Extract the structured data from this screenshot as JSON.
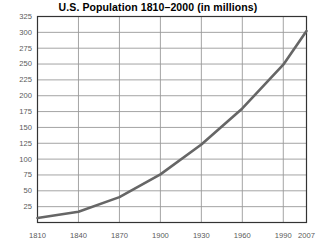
{
  "chart_data": {
    "type": "line",
    "title": "U.S. Population 1810–2000 (in millions)",
    "xlabel": "",
    "ylabel": "",
    "grid": true,
    "legend": null,
    "xlim": [
      1810,
      2007
    ],
    "ylim": [
      0,
      325
    ],
    "x_ticks": [
      1810,
      1840,
      1870,
      1900,
      1930,
      1960,
      1990,
      2007
    ],
    "x_tick_labels": [
      "1810",
      "1840",
      "1870",
      "1900",
      "1930",
      "1960",
      "1990",
      "2007"
    ],
    "y_ticks": [
      25,
      50,
      75,
      100,
      125,
      150,
      175,
      200,
      225,
      250,
      275,
      300,
      325
    ],
    "y_tick_labels": [
      "25",
      "50",
      "75",
      "100",
      "125",
      "150",
      "175",
      "200",
      "225",
      "250",
      "275",
      "300",
      "325"
    ],
    "line_color": "#666666",
    "grid_color": "#9a9a9a",
    "axis_color": "#333333",
    "series": [
      {
        "name": "U.S. Population",
        "x": [
          1810,
          1840,
          1870,
          1900,
          1930,
          1960,
          1990,
          2007
        ],
        "values": [
          7,
          17,
          40,
          76,
          123,
          180,
          249,
          302
        ]
      }
    ]
  }
}
